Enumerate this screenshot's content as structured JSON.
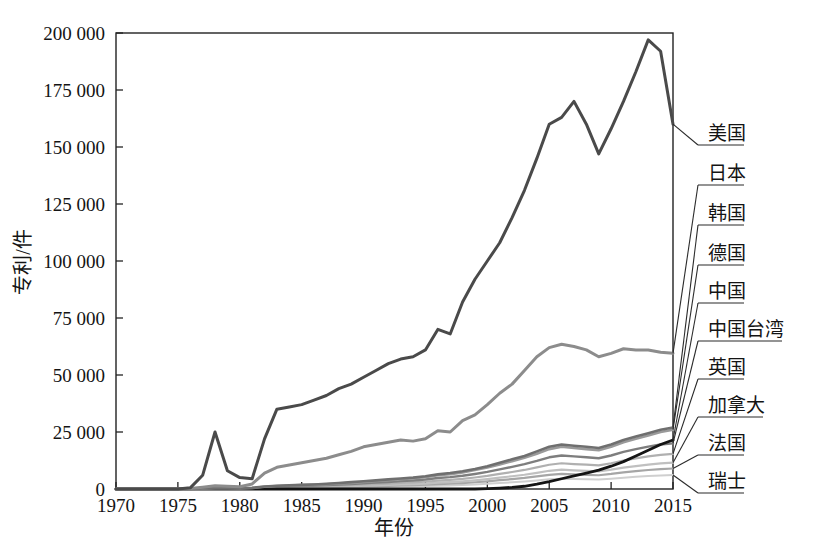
{
  "chart_data": {
    "type": "line",
    "title": "",
    "xlabel": "年份",
    "ylabel": "专利/件",
    "xlim": [
      1970,
      2015
    ],
    "ylim": [
      0,
      200000
    ],
    "grid": false,
    "legend_position": "right-labels-with-leader-lines",
    "xticks": [
      1970,
      1975,
      1980,
      1985,
      1990,
      1995,
      2000,
      2005,
      2010,
      2015
    ],
    "xtick_labels": [
      "1970",
      "1975",
      "1980",
      "1985",
      "1990",
      "1995",
      "2000",
      "2005",
      "2010",
      "2015"
    ],
    "yticks": [
      0,
      25000,
      50000,
      75000,
      100000,
      125000,
      150000,
      175000,
      200000
    ],
    "ytick_labels": [
      "0",
      "25 000",
      "50 000",
      "75 000",
      "100 000",
      "125 000",
      "150 000",
      "175 000",
      "200 000"
    ],
    "x": [
      1970,
      1971,
      1972,
      1973,
      1974,
      1975,
      1976,
      1977,
      1978,
      1979,
      1980,
      1981,
      1982,
      1983,
      1984,
      1985,
      1986,
      1987,
      1988,
      1989,
      1990,
      1991,
      1992,
      1993,
      1994,
      1995,
      1996,
      1997,
      1998,
      1999,
      2000,
      2001,
      2002,
      2003,
      2004,
      2005,
      2006,
      2007,
      2008,
      2009,
      2010,
      2011,
      2012,
      2013,
      2014,
      2015
    ],
    "series": [
      {
        "name": "美国",
        "color": "#4a4a4a",
        "width": 3.0,
        "label_y_value": 143000,
        "values": [
          0,
          0,
          0,
          0,
          0,
          0,
          500,
          6000,
          25000,
          8000,
          5000,
          4500,
          22000,
          35000,
          36000,
          37000,
          39000,
          41000,
          44000,
          46000,
          49000,
          52000,
          55000,
          57000,
          58000,
          61000,
          70000,
          68000,
          82000,
          92000,
          100000,
          108000,
          119000,
          131000,
          145000,
          160000,
          163000,
          170000,
          160000,
          147000,
          158000,
          170000,
          183000,
          197000,
          192000,
          160000
        ]
      },
      {
        "name": "日本",
        "color": "#8c8c8c",
        "width": 3.0,
        "label_y_value": 118000,
        "values": [
          0,
          0,
          0,
          0,
          0,
          0,
          200,
          800,
          1400,
          1200,
          1000,
          2200,
          7000,
          9500,
          10500,
          11500,
          12500,
          13500,
          15000,
          16500,
          18500,
          19500,
          20500,
          21500,
          21000,
          22000,
          25500,
          25000,
          30000,
          32500,
          37000,
          42000,
          46000,
          52000,
          58000,
          62000,
          63500,
          62500,
          61000,
          58000,
          59500,
          61500,
          61000,
          61000,
          60000,
          59500
        ]
      },
      {
        "name": "韩国",
        "color": "#6f6f6f",
        "width": 2.6,
        "label_y_value": 100000,
        "values": [
          0,
          0,
          0,
          0,
          0,
          0,
          60,
          200,
          400,
          350,
          300,
          500,
          1100,
          1400,
          1600,
          1800,
          2000,
          2300,
          2600,
          3000,
          3400,
          3800,
          4200,
          4600,
          5000,
          5600,
          6400,
          7000,
          7800,
          8800,
          10000,
          11500,
          13000,
          14500,
          16500,
          18500,
          19500,
          19000,
          18500,
          18000,
          19500,
          21500,
          23000,
          24500,
          26000,
          27000
        ]
      },
      {
        "name": "德国",
        "color": "#9a9a9a",
        "width": 2.6,
        "label_y_value": 84000,
        "values": [
          0,
          0,
          0,
          0,
          0,
          0,
          50,
          180,
          360,
          320,
          280,
          450,
          1000,
          1300,
          1500,
          1700,
          1900,
          2100,
          2400,
          2700,
          3100,
          3500,
          3900,
          4300,
          4700,
          5200,
          6000,
          6500,
          7300,
          8300,
          9400,
          10800,
          12200,
          13700,
          15500,
          17500,
          18500,
          18000,
          17500,
          17000,
          18500,
          20500,
          22000,
          23500,
          25000,
          26000
        ]
      },
      {
        "name": "中国",
        "color": "#141414",
        "width": 2.8,
        "label_y_value": 66000,
        "values": [
          0,
          0,
          0,
          0,
          0,
          0,
          0,
          0,
          0,
          0,
          0,
          0,
          0,
          0,
          0,
          0,
          0,
          0,
          0,
          0,
          0,
          0,
          0,
          0,
          0,
          0,
          0,
          0,
          0,
          0,
          200,
          400,
          700,
          1200,
          2100,
          3200,
          4500,
          5800,
          7000,
          8300,
          10000,
          12000,
          14500,
          17000,
          19500,
          21500
        ]
      },
      {
        "name": "中国台湾",
        "color": "#7e7e7e",
        "width": 2.4,
        "label_y_value": 51000,
        "values": [
          0,
          0,
          0,
          0,
          0,
          0,
          40,
          150,
          300,
          270,
          240,
          380,
          850,
          1100,
          1250,
          1400,
          1550,
          1750,
          1950,
          2200,
          2500,
          2800,
          3100,
          3450,
          3750,
          4150,
          4800,
          5200,
          5800,
          6600,
          7500,
          8600,
          9700,
          10900,
          12300,
          13900,
          14700,
          14300,
          13900,
          13500,
          14700,
          16300,
          17500,
          18600,
          19500,
          20000
        ]
      },
      {
        "name": "英国",
        "color": "#b0b0b0",
        "width": 2.2,
        "label_y_value": 36500,
        "values": [
          0,
          0,
          0,
          0,
          0,
          0,
          30,
          120,
          240,
          210,
          190,
          300,
          650,
          850,
          970,
          1080,
          1200,
          1350,
          1500,
          1700,
          1920,
          2150,
          2380,
          2650,
          2880,
          3180,
          3680,
          4000,
          4450,
          5050,
          5750,
          6600,
          7450,
          8350,
          9450,
          10650,
          11300,
          10950,
          10650,
          10350,
          11300,
          12500,
          13400,
          14300,
          15000,
          15400
        ]
      },
      {
        "name": "加拿大",
        "color": "#c0c0c0",
        "width": 2.2,
        "label_y_value": 21000,
        "values": [
          0,
          0,
          0,
          0,
          0,
          0,
          22,
          90,
          180,
          160,
          140,
          225,
          490,
          640,
          730,
          810,
          900,
          1010,
          1130,
          1280,
          1440,
          1610,
          1790,
          1990,
          2160,
          2390,
          2760,
          3000,
          3340,
          3790,
          4310,
          4950,
          5590,
          6260,
          7090,
          7990,
          8480,
          8210,
          7990,
          7760,
          8480,
          9380,
          10050,
          10720,
          11250,
          11550
        ]
      },
      {
        "name": "法国",
        "color": "#a6a6a6",
        "width": 2.2,
        "label_y_value": 6000,
        "values": [
          0,
          0,
          0,
          0,
          0,
          0,
          18,
          70,
          140,
          125,
          110,
          175,
          380,
          500,
          570,
          630,
          700,
          790,
          880,
          1000,
          1120,
          1250,
          1390,
          1550,
          1680,
          1860,
          2150,
          2330,
          2600,
          2950,
          3350,
          3850,
          4350,
          4870,
          5520,
          6220,
          6600,
          6390,
          6220,
          6040,
          6600,
          7300,
          7820,
          8340,
          8750,
          8990
        ]
      },
      {
        "name": "瑞士",
        "color": "#cfcfcf",
        "width": 2.0,
        "label_y_value": -9000,
        "values": [
          0,
          0,
          0,
          0,
          0,
          0,
          12,
          48,
          95,
          85,
          75,
          120,
          260,
          340,
          390,
          430,
          478,
          538,
          600,
          680,
          765,
          855,
          950,
          1055,
          1145,
          1265,
          1465,
          1585,
          1770,
          2010,
          2285,
          2620,
          2960,
          3315,
          3760,
          4235,
          4495,
          4350,
          4235,
          4115,
          4495,
          4970,
          5320,
          5680,
          5960,
          6120
        ]
      }
    ]
  },
  "axis": {
    "x_title": "年份",
    "y_title": "专利/件"
  },
  "labels": {
    "usa": "美国",
    "japan": "日本",
    "korea": "韩国",
    "germany": "德国",
    "china": "中国",
    "taiwan": "中国台湾",
    "uk": "英国",
    "canada": "加拿大",
    "france": "法国",
    "switzerland": "瑞士"
  },
  "colors": {
    "frame": "#222222",
    "text": "#141414",
    "usa_line": "#4a4a4a",
    "japan_line": "#8c8c8c",
    "china_line": "#141414",
    "background": "#ffffff"
  }
}
